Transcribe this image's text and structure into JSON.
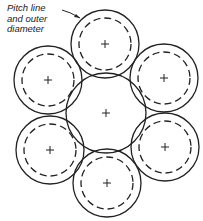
{
  "diagram": {
    "label": {
      "lines": [
        "Pitch line",
        "and outer",
        "diameter"
      ]
    },
    "colors": {
      "stroke": "#222222",
      "background": "#ffffff"
    },
    "center_circle": {
      "cx": 106,
      "cy": 113,
      "r": 40
    },
    "outer_circles": [
      {
        "name": "top",
        "cx": 105,
        "cy": 44,
        "r": 34,
        "dash_r": 26
      },
      {
        "name": "upper-left",
        "cx": 48,
        "cy": 80,
        "r": 34,
        "dash_r": 26
      },
      {
        "name": "upper-right",
        "cx": 164,
        "cy": 78,
        "r": 34,
        "dash_r": 26
      },
      {
        "name": "lower-left",
        "cx": 50,
        "cy": 150,
        "r": 34,
        "dash_r": 26
      },
      {
        "name": "lower-right",
        "cx": 165,
        "cy": 147,
        "r": 34,
        "dash_r": 26
      },
      {
        "name": "bottom",
        "cx": 107,
        "cy": 183,
        "r": 34,
        "dash_r": 26
      }
    ]
  }
}
